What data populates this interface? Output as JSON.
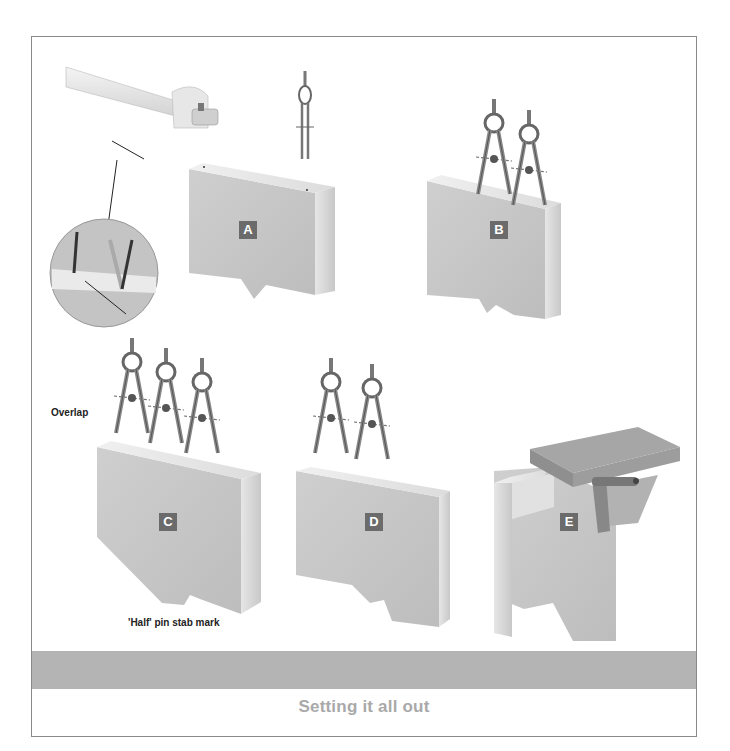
{
  "page": {
    "caption": "Setting it all out",
    "band_color": "#b4b4b4",
    "caption_color": "#a9a9a9"
  },
  "figures": [
    {
      "id": "A",
      "label": "A",
      "description": "Timber block with marked edge"
    },
    {
      "id": "B",
      "label": "B",
      "description": "Two dividers stepping off on block"
    },
    {
      "id": "C",
      "label": "C",
      "description": "Three dividers stepping off with overlap detail"
    },
    {
      "id": "D",
      "label": "D",
      "description": "Two dividers adjusting spacing"
    },
    {
      "id": "E",
      "label": "E",
      "description": "Block with square and marked waste"
    }
  ],
  "tools": {
    "marking_gauge": "marking-gauge",
    "dividers": "dividers"
  },
  "callouts": {
    "overlap": "Overlap",
    "half_pin": "'Half' pin stab mark"
  }
}
